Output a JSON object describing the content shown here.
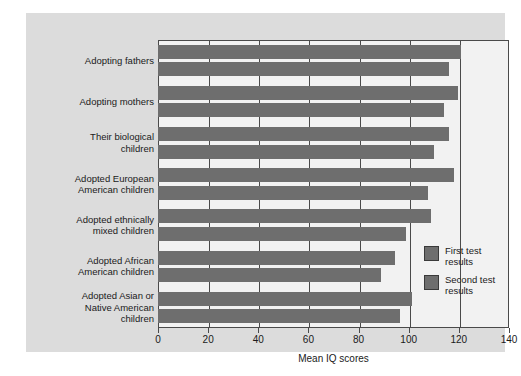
{
  "chart_data": {
    "type": "bar",
    "orientation": "horizontal",
    "title": "",
    "xlabel": "Mean IQ scores",
    "ylabel": "",
    "xlim": [
      0,
      140
    ],
    "xticks": [
      0,
      20,
      40,
      60,
      80,
      100,
      120,
      140
    ],
    "xtick_labels": [
      "0",
      "20",
      "40",
      "60",
      "80",
      "100",
      "120",
      "140"
    ],
    "grid": true,
    "legend_position": "inside-right",
    "categories": [
      "Adopting fathers",
      "Adopting mothers",
      "Their biological children",
      "Adopted European American children",
      "Adopted ethnically mixed children",
      "Adopted African American children",
      "Adopted Asian or Native American children"
    ],
    "category_label_lines": [
      [
        "Adopting fathers"
      ],
      [
        "Adopting mothers"
      ],
      [
        "Their biological",
        "children"
      ],
      [
        "Adopted European",
        "American children"
      ],
      [
        "Adopted ethnically",
        "mixed children"
      ],
      [
        "Adopted African",
        "American children"
      ],
      [
        "Adopted Asian or",
        "Native American",
        "children"
      ]
    ],
    "series": [
      {
        "name": "First test results",
        "color": "#6e6e6e",
        "values": [
          121,
          119.5,
          116,
          118,
          109,
          94.5,
          101.5
        ]
      },
      {
        "name": "Second test results",
        "color": "#6e6e6e",
        "values": [
          116,
          114,
          110,
          107.5,
          99,
          89,
          96.5
        ]
      }
    ]
  },
  "legend": {
    "items": [
      {
        "label_lines": [
          "First test",
          "results"
        ],
        "color": "#6e6e6e"
      },
      {
        "label_lines": [
          "Second test",
          "results"
        ],
        "color": "#6e6e6e"
      }
    ]
  },
  "colors": {
    "bar": "#6e6e6e",
    "panel_background": "#dcdcdc",
    "plot_background": "#f2f2f2",
    "axis": "#4a4a4a",
    "text": "#1a1a1a"
  }
}
